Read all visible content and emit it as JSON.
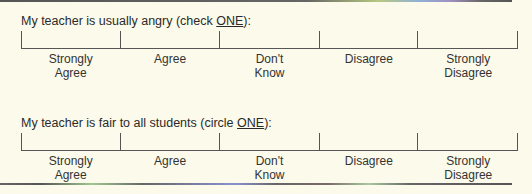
{
  "questions": [
    {
      "prefix": "My teacher is usually angry (check ",
      "emphasis": "ONE",
      "suffix": "):",
      "options": [
        {
          "line1": "Strongly",
          "line2": "Agree"
        },
        {
          "line1": "Agree",
          "line2": ""
        },
        {
          "line1": "Don't",
          "line2": "Know"
        },
        {
          "line1": "Disagree",
          "line2": ""
        },
        {
          "line1": "Strongly",
          "line2": "Disagree"
        }
      ]
    },
    {
      "prefix": "My teacher is fair to all students (circle ",
      "emphasis": "ONE",
      "suffix": "):",
      "options": [
        {
          "line1": "Strongly",
          "line2": "Agree"
        },
        {
          "line1": "Agree",
          "line2": ""
        },
        {
          "line1": "Don't",
          "line2": "Know"
        },
        {
          "line1": "Disagree",
          "line2": ""
        },
        {
          "line1": "Strongly",
          "line2": "Disagree"
        }
      ]
    }
  ]
}
